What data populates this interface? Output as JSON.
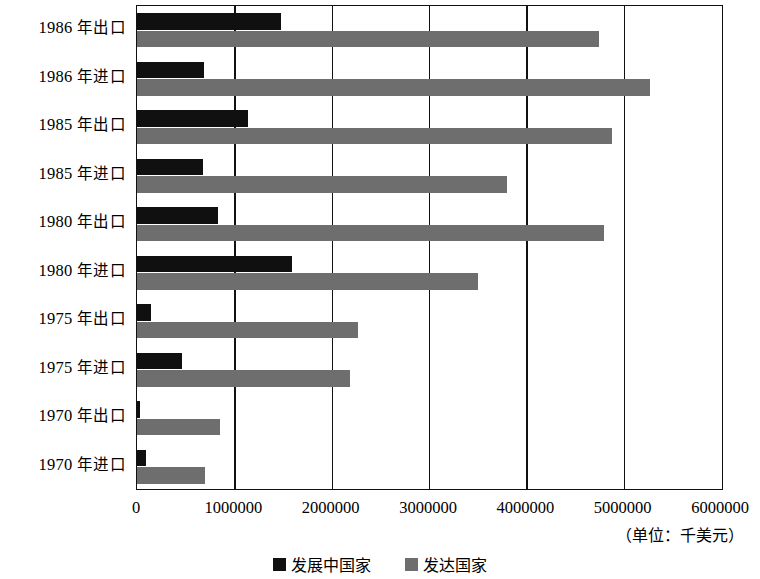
{
  "chart_data": {
    "type": "bar",
    "orientation": "horizontal",
    "title": "",
    "subtitle": "",
    "xlabel": "",
    "ylabel": "",
    "unit_note": "（单位：千美元）",
    "xlim": [
      0,
      6000000
    ],
    "xticks": [
      "0",
      "1000000",
      "2000000",
      "3000000",
      "4000000",
      "5000000",
      "6000000"
    ],
    "xtick_values": [
      0,
      1000000,
      2000000,
      3000000,
      4000000,
      5000000,
      6000000
    ],
    "grid": true,
    "grid_axis": "x",
    "legend_position": "bottom",
    "categories": [
      "1986 年出口",
      "1986 年进口",
      "1985 年出口",
      "1985 年进口",
      "1980 年出口",
      "1980 年进口",
      "1975 年出口",
      "1975 年进口",
      "1970 年出口",
      "1970 年进口"
    ],
    "category_parts": [
      {
        "year": "1986",
        "flow": "年出口"
      },
      {
        "year": "1986",
        "flow": "年进口"
      },
      {
        "year": "1985",
        "flow": "年出口"
      },
      {
        "year": "1985",
        "flow": "年进口"
      },
      {
        "year": "1980",
        "flow": "年出口"
      },
      {
        "year": "1980",
        "flow": "年进口"
      },
      {
        "year": "1975",
        "flow": "年出口"
      },
      {
        "year": "1975",
        "flow": "年进口"
      },
      {
        "year": "1970",
        "flow": "年出口"
      },
      {
        "year": "1970",
        "flow": "年进口"
      }
    ],
    "series": [
      {
        "name": "发展中国家",
        "color": "#101010",
        "values": [
          1480000,
          690000,
          1140000,
          680000,
          830000,
          1595000,
          140000,
          460000,
          30000,
          95000
        ]
      },
      {
        "name": "发达国家",
        "color": "#6e6e6e",
        "values": [
          4750000,
          5270000,
          4880000,
          3800000,
          4800000,
          3500000,
          2270000,
          2190000,
          850000,
          700000
        ]
      }
    ]
  },
  "legend": {
    "items": [
      {
        "label": "发展中国家",
        "swatch": "dev"
      },
      {
        "label": "发达国家",
        "swatch": "adv"
      }
    ]
  }
}
